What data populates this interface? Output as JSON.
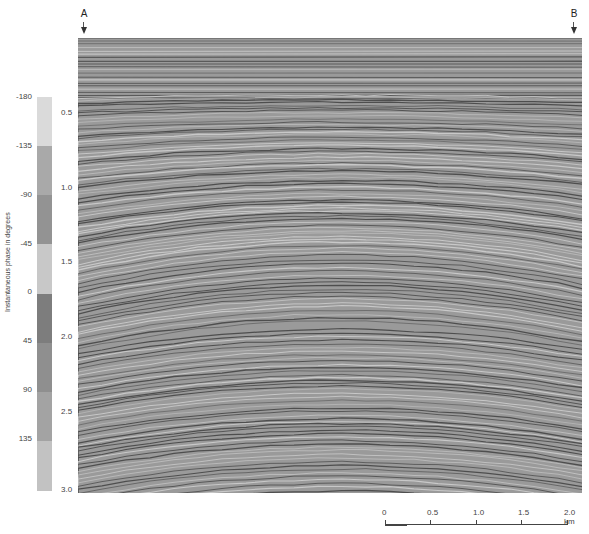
{
  "markers": [
    {
      "label": "A",
      "x": 84
    },
    {
      "label": "B",
      "x": 574
    }
  ],
  "time_axis": {
    "ticks": [
      {
        "label": "0.5",
        "y": 113
      },
      {
        "label": "1.0",
        "y": 188
      },
      {
        "label": "1.5",
        "y": 262
      },
      {
        "label": "2.0",
        "y": 337
      },
      {
        "label": "2.5",
        "y": 412
      },
      {
        "label": "3.0",
        "y": 490
      }
    ]
  },
  "colorbar": {
    "title": "Instantaneous phase in degrees",
    "labels": [
      {
        "label": "-180",
        "y": 97
      },
      {
        "label": "-135",
        "y": 146
      },
      {
        "label": "-90",
        "y": 195
      },
      {
        "label": "-45",
        "y": 244
      },
      {
        "label": "0",
        "y": 292
      },
      {
        "label": "45",
        "y": 341
      },
      {
        "label": "90",
        "y": 390
      },
      {
        "label": "135",
        "y": 439
      }
    ],
    "segments": [
      {
        "from": -180,
        "to": -135,
        "color": "#dadada"
      },
      {
        "from": -135,
        "to": -90,
        "color": "#a9a9a9"
      },
      {
        "from": -90,
        "to": -45,
        "color": "#939393"
      },
      {
        "from": -45,
        "to": 0,
        "color": "#c8c8c8"
      },
      {
        "from": 0,
        "to": 45,
        "color": "#7d7d7d"
      },
      {
        "from": 45,
        "to": 90,
        "color": "#8f8f8f"
      },
      {
        "from": 90,
        "to": 135,
        "color": "#a3a3a3"
      },
      {
        "from": 135,
        "to": 180,
        "color": "#c2c2c2"
      }
    ]
  },
  "scalebar": {
    "unit": "km",
    "ticks": [
      {
        "label": "0",
        "x": 0
      },
      {
        "label": "0.5",
        "x": 45
      },
      {
        "label": "1.0",
        "x": 91
      },
      {
        "label": "1.5",
        "x": 136
      },
      {
        "label": "2.0 km",
        "x": 182
      }
    ]
  }
}
